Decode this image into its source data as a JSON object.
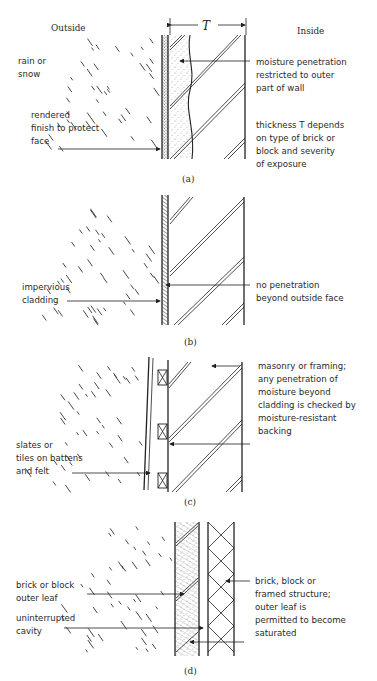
{
  "headers": {
    "outside": "Outside",
    "inside": "Inside",
    "thickness_symbol": "T"
  },
  "panels": [
    {
      "id": "a",
      "caption": "(a)",
      "labels_left": [
        [
          "rain or",
          "snow"
        ],
        [
          "rendered",
          "finish to protect",
          "face"
        ]
      ],
      "labels_right": [
        [
          "moisture penetration",
          "restricted to outer",
          "part of wall"
        ],
        [
          "thickness T depends",
          "on type of brick or",
          "block and severity",
          "of exposure"
        ]
      ]
    },
    {
      "id": "b",
      "caption": "(b)",
      "labels_left": [
        [
          "impervious",
          "cladding"
        ]
      ],
      "labels_right": [
        [
          "no penetration",
          "beyond outside face"
        ]
      ]
    },
    {
      "id": "c",
      "caption": "(c)",
      "labels_left": [
        [
          "slates or",
          "tiles on battens",
          "and felt"
        ]
      ],
      "labels_right": [
        [
          "masonry or framing;",
          "any penetration of",
          "moisture beyond",
          "cladding is checked by",
          "moisture-resistant",
          "backing"
        ]
      ]
    },
    {
      "id": "d",
      "caption": "(d)",
      "labels_left": [
        [
          "brick or block",
          "outer leaf"
        ],
        [
          "uninterrupted",
          "cavity"
        ]
      ],
      "labels_right": [
        [
          "brick, block or",
          "framed structure;",
          "outer leaf is",
          "permitted to become",
          "saturated"
        ]
      ]
    }
  ]
}
